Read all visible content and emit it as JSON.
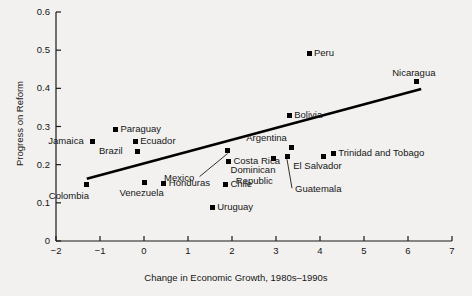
{
  "chart_data": {
    "type": "scatter",
    "title": "",
    "xlabel": "Change in Economic Growth, 1980s–1990s",
    "ylabel": "Progress on Reform",
    "xlim": [
      -2,
      7
    ],
    "ylim": [
      0,
      0.6
    ],
    "xticks": [
      "-2",
      "-1",
      "0",
      "1",
      "2",
      "3",
      "4",
      "5",
      "6",
      "7"
    ],
    "yticks": [
      "0",
      "0.1",
      "0.2",
      "0.3",
      "0.4",
      "0.5",
      "0.6"
    ],
    "grid": false,
    "legend": "none",
    "points": [
      {
        "name": "Colombia",
        "x": -1.3,
        "y": 0.148,
        "label_pos": "below-left"
      },
      {
        "name": "Jamaica",
        "x": -1.18,
        "y": 0.26,
        "label_pos": "left"
      },
      {
        "name": "Paraguay",
        "x": -0.65,
        "y": 0.293,
        "label_pos": "right"
      },
      {
        "name": "Ecuador",
        "x": -0.2,
        "y": 0.262,
        "label_pos": "right"
      },
      {
        "name": "Brazil",
        "x": -0.15,
        "y": 0.235,
        "label_pos": "left"
      },
      {
        "name": "Venezuela",
        "x": 0.0,
        "y": 0.152,
        "label_pos": "below"
      },
      {
        "name": "Honduras",
        "x": 0.45,
        "y": 0.15,
        "label_pos": "right"
      },
      {
        "name": "Uruguay",
        "x": 1.55,
        "y": 0.088,
        "label_pos": "right"
      },
      {
        "name": "Chile",
        "x": 1.85,
        "y": 0.148,
        "label_pos": "right"
      },
      {
        "name": "Mexico",
        "x": 1.9,
        "y": 0.237,
        "label_pos": "leader-below-left"
      },
      {
        "name": "Costa Rica",
        "x": 1.92,
        "y": 0.207,
        "label_pos": "right"
      },
      {
        "name": "Dominican Republic",
        "x": 2.95,
        "y": 0.215,
        "label_pos": "below-left"
      },
      {
        "name": "Argentina",
        "x": 3.35,
        "y": 0.245,
        "label_pos": "above-left"
      },
      {
        "name": "Guatemala",
        "x": 3.25,
        "y": 0.222,
        "label_pos": "leader-below-right"
      },
      {
        "name": "Bolivia",
        "x": 3.3,
        "y": 0.33,
        "label_pos": "right"
      },
      {
        "name": "Peru",
        "x": 3.75,
        "y": 0.49,
        "label_pos": "right"
      },
      {
        "name": "El Salvador",
        "x": 4.07,
        "y": 0.222,
        "label_pos": "below"
      },
      {
        "name": "Trinidad and Tobago",
        "x": 4.3,
        "y": 0.228,
        "label_pos": "right"
      },
      {
        "name": "Nicaragua",
        "x": 6.2,
        "y": 0.417,
        "label_pos": "above"
      }
    ],
    "trendline": {
      "x0": -1.3,
      "y0": 0.163,
      "x1": 6.3,
      "y1": 0.398,
      "color": "#000000"
    }
  }
}
